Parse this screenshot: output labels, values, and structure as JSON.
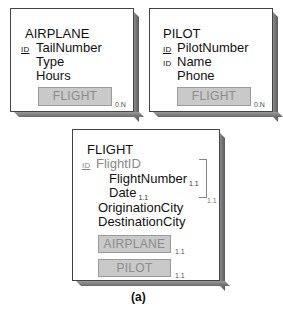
{
  "objects": {
    "airplane": {
      "title": "AIRPLANE",
      "attributes": [
        {
          "id": true,
          "label": "TailNumber"
        },
        {
          "id": false,
          "label": "Type"
        },
        {
          "id": false,
          "label": "Hours"
        }
      ],
      "id_tag": "ID",
      "ref": {
        "label": "FLIGHT",
        "cardinality": "0.N"
      }
    },
    "pilot": {
      "title": "PILOT",
      "attributes": [
        {
          "id": true,
          "label": "PilotNumber"
        },
        {
          "id": true,
          "label": "Name"
        },
        {
          "id": false,
          "label": "Phone"
        }
      ],
      "id_tag": "ID",
      "ref": {
        "label": "FLIGHT",
        "cardinality": "0.N"
      }
    },
    "flight": {
      "title": "FLIGHT",
      "id_tag": "ID",
      "group": {
        "label": "FlightID",
        "cardinality": "1.1",
        "members": [
          {
            "label": "FlightNumber",
            "cardinality": "1.1"
          },
          {
            "label": "Date",
            "cardinality": "1.1"
          }
        ]
      },
      "attributes": [
        {
          "label": "OriginationCity"
        },
        {
          "label": "DestinationCity"
        }
      ],
      "refs": [
        {
          "label": "AIRPLANE",
          "cardinality": "1.1"
        },
        {
          "label": "PILOT",
          "cardinality": "1.1"
        }
      ]
    }
  },
  "caption": "(a)"
}
